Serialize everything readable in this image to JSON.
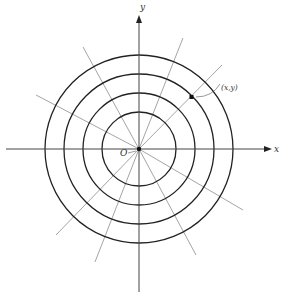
{
  "diagram": {
    "title": "",
    "center": {
      "x": 139,
      "y": 149
    },
    "origin_label": "O",
    "x_axis_label": "x",
    "y_axis_label": "y",
    "point_label": "(x,y)",
    "circle_radii": [
      37,
      56,
      75,
      94
    ],
    "radial_lines": [
      {
        "x2": 183,
        "y2": 38
      },
      {
        "x2": 222,
        "y2": 65
      },
      {
        "x2": 83,
        "y2": 47
      },
      {
        "x2": 36,
        "y2": 95
      },
      {
        "x2": 243,
        "y2": 210
      },
      {
        "x2": 196,
        "y2": 255
      },
      {
        "x2": 56,
        "y2": 235
      },
      {
        "x2": 95,
        "y2": 262
      }
    ],
    "point": {
      "x": 192,
      "y": 97
    },
    "colors": {
      "circle": "#222222",
      "radial": "#9a9a9a",
      "axis": "#444444",
      "background": "#ffffff"
    }
  }
}
